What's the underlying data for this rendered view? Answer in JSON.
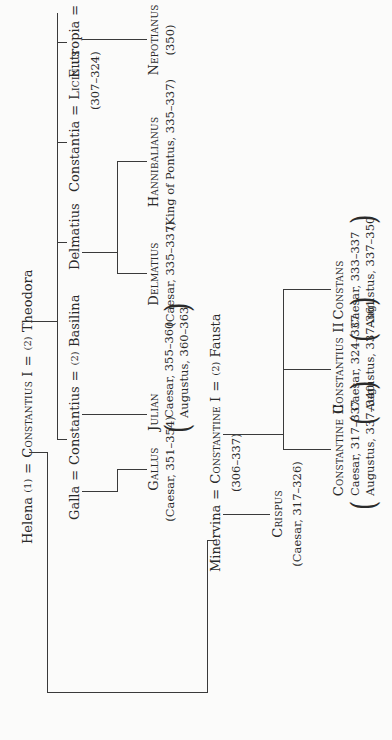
{
  "diagram": {
    "type": "family-tree",
    "orientation": "rotated-90-ccw",
    "generation_1": {
      "person_1": "Helena",
      "marriage_1": "(1)",
      "central": "Constantius I",
      "marriage_2": "(2)",
      "person_2": "Theodora"
    },
    "generation_2": {
      "galla": "Galla",
      "constantius": "Constantius",
      "basilina_num": "(2)",
      "basilina": "Basilina",
      "delmatius": "Delmatius",
      "constantia": "Constantia",
      "licinius": "Licinius",
      "licinius_dates": "(307–324)",
      "eutropia": "Eutropia",
      "nepotianus": "Nepotianus"
    },
    "generation_3": {
      "gallus": "Gallus",
      "gallus_dates": "(Caesar, 351–354)",
      "julian": "Julian",
      "julian_line1": "Caesar, 355–360",
      "julian_line2": "Augustus, 360–363",
      "delmatius_jr": "Delmatius",
      "delmatius_jr_dates": "(Caesar, 335–337)",
      "hannibalianus": "Hannibalianus",
      "hannibalianus_dates": "(King of Pontus, 335–337)",
      "nepotianus_jr": "Nepotianus",
      "nepotianus_jr_dates": "(350)"
    },
    "constantine_line": {
      "minervina": "Minervina",
      "constantine": "Constantine I",
      "constantine_dates": "(306–337)",
      "fausta_num": "(2)",
      "fausta": "Fausta"
    },
    "crispus": {
      "name": "Crispus",
      "dates": "(Caesar, 317–326)"
    },
    "sons": [
      {
        "name": "Constantine II",
        "line1": "Caesar, 317–337",
        "line2": "Augustus, 337–340"
      },
      {
        "name": "Constantius II",
        "line1": "Caesar, 324–337",
        "line2": "Augustus, 337–361"
      },
      {
        "name": "Constans",
        "line1": "Caesar, 333–337",
        "line2": "Augustus, 337–350"
      }
    ],
    "symbols": {
      "equals": "=",
      "num_1": "(1)",
      "num_2": "(2)"
    }
  }
}
